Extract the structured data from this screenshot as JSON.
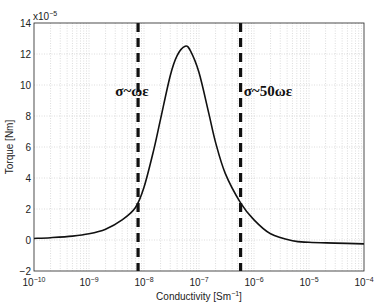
{
  "chart_data": {
    "type": "line",
    "title": "",
    "xlabel": "Conductivity [Sm⁻¹]",
    "ylabel": "Torque [Nm]",
    "x_scale": "log",
    "xlim": [
      1e-10,
      0.0001
    ],
    "ylim": [
      -2,
      14
    ],
    "y_multiplier": "x10^-5",
    "grid": true,
    "x_ticks": [
      "10^-10",
      "10^-9",
      "10^-8",
      "10^-7",
      "10^-6",
      "10^-5",
      "10^-4"
    ],
    "y_ticks": [
      -2,
      0,
      2,
      4,
      6,
      8,
      10,
      12,
      14
    ],
    "series": [
      {
        "name": "Torque",
        "x": [
          1e-10,
          2e-10,
          5e-10,
          1e-09,
          2e-09,
          4e-09,
          7e-09,
          1e-08,
          1.5e-08,
          2e-08,
          3e-08,
          4e-08,
          5.6e-08,
          7e-08,
          1e-07,
          1.5e-07,
          2e-07,
          3e-07,
          5.7e-07,
          1e-06,
          2e-06,
          5e-06,
          1e-05,
          3e-05,
          0.0001
        ],
        "values": [
          0.1,
          0.15,
          0.25,
          0.4,
          0.7,
          1.3,
          2.1,
          3.4,
          5.8,
          7.8,
          10.6,
          11.9,
          12.5,
          12.2,
          10.8,
          8.2,
          6.3,
          4.3,
          2.4,
          1.3,
          0.4,
          -0.05,
          -0.15,
          -0.2,
          -0.25
        ]
      }
    ],
    "vlines": [
      {
        "x": 7.8e-09,
        "style": "dashed",
        "label": "σ~ωε"
      },
      {
        "x": 5.7e-07,
        "style": "dashed",
        "label": "σ~50ωε"
      }
    ],
    "annotations": [
      {
        "text": "σ~ωε",
        "x": 3e-09,
        "y": 9.3
      },
      {
        "text": "σ~50ωε",
        "x": 6.5e-07,
        "y": 9.3
      }
    ]
  }
}
